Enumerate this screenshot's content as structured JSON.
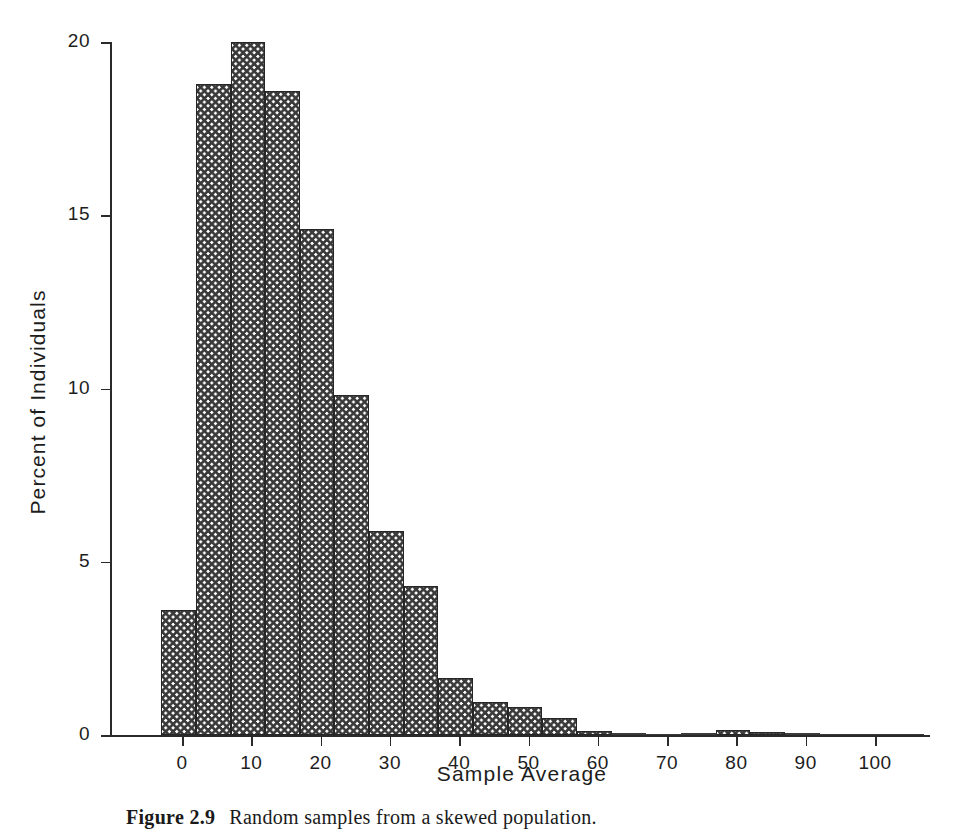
{
  "figure": {
    "caption_number": "Figure 2.9",
    "caption_text": "Random samples from a skewed population."
  },
  "chart_data": {
    "type": "bar",
    "title": "",
    "subtitle": "",
    "xlabel": "Sample Average",
    "ylabel": "Percent of Individuals",
    "xlim": [
      -5,
      110
    ],
    "ylim": [
      0,
      20
    ],
    "xticks": [
      0,
      10,
      20,
      30,
      40,
      50,
      60,
      70,
      80,
      90,
      100
    ],
    "xtick_labels": [
      "0",
      "10",
      "20",
      "30",
      "40",
      "50",
      "60",
      "70",
      "80",
      "90",
      "100"
    ],
    "yticks": [
      0,
      5,
      10,
      15,
      20
    ],
    "ytick_labels": [
      "0",
      "5",
      "10",
      "15",
      "20"
    ],
    "grid": false,
    "legend": "none",
    "bin_width": 5,
    "bin_edges": [
      -3,
      2,
      7,
      12,
      17,
      22,
      27,
      32,
      37,
      42,
      47,
      52,
      57,
      62,
      67,
      72,
      77,
      82,
      87,
      92,
      97,
      102,
      107
    ],
    "categories": [
      "-3 to 2",
      "2 to 7",
      "7 to 12",
      "12 to 17",
      "17 to 22",
      "22 to 27",
      "27 to 32",
      "32 to 37",
      "37 to 42",
      "42 to 47",
      "47 to 52",
      "52 to 57",
      "57 to 62",
      "62 to 67",
      "67 to 72",
      "72 to 77",
      "77 to 82",
      "82 to 87",
      "87 to 92",
      "92 to 97",
      "97 to 102",
      "102 to 107"
    ],
    "values": [
      3.6,
      18.8,
      20.0,
      18.6,
      14.6,
      9.8,
      5.9,
      4.3,
      1.65,
      0.95,
      0.8,
      0.5,
      0.12,
      0.05,
      0.04,
      0.06,
      0.14,
      0.1,
      0.05,
      0.04,
      0.03,
      0.02
    ],
    "series": [
      {
        "name": "Percent of Individuals",
        "values": [
          3.6,
          18.8,
          20.0,
          18.6,
          14.6,
          9.8,
          5.9,
          4.3,
          1.65,
          0.95,
          0.8,
          0.5,
          0.12,
          0.05,
          0.04,
          0.06,
          0.14,
          0.1,
          0.05,
          0.04,
          0.03,
          0.02
        ]
      }
    ],
    "bar_fill": "crosshatch",
    "bar_edge_color": "#262626",
    "background_color": "#ffffff"
  }
}
